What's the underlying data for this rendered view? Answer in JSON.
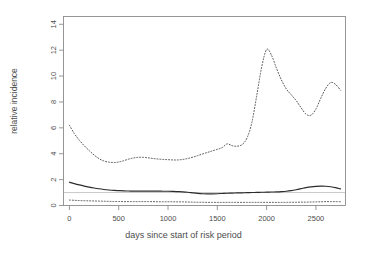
{
  "chart_data": {
    "type": "line",
    "title": "",
    "xlabel": "days since start of risk period",
    "ylabel": "relative incidence",
    "xlim": [
      -60,
      2800
    ],
    "ylim": [
      0,
      14.6
    ],
    "xticks": [
      0,
      500,
      1000,
      1500,
      2000,
      2500
    ],
    "yticks": [
      0,
      2,
      4,
      6,
      8,
      10,
      12,
      14
    ],
    "xtick_labels": [
      "0",
      "500",
      "1000",
      "1500",
      "2000",
      "2500"
    ],
    "ytick_labels": [
      "0",
      "2",
      "4",
      "6",
      "8",
      "10",
      "12",
      "14"
    ],
    "grid": false,
    "legend": "none",
    "reference_line": {
      "y": 1,
      "style": "solid",
      "color": "#b0b0b0"
    },
    "x": [
      0,
      50,
      100,
      150,
      200,
      250,
      300,
      350,
      400,
      450,
      500,
      550,
      600,
      650,
      700,
      750,
      800,
      850,
      900,
      950,
      1000,
      1050,
      1100,
      1150,
      1200,
      1250,
      1300,
      1350,
      1400,
      1450,
      1500,
      1550,
      1600,
      1650,
      1700,
      1750,
      1800,
      1850,
      1900,
      1950,
      2000,
      2050,
      2100,
      2150,
      2200,
      2250,
      2300,
      2350,
      2400,
      2450,
      2500,
      2550,
      2600,
      2650,
      2700,
      2750
    ],
    "series": [
      {
        "name": "upper confidence limit",
        "style": "dotted",
        "color": "#555555",
        "values": [
          6.2,
          5.55,
          5.05,
          4.62,
          4.25,
          3.9,
          3.62,
          3.44,
          3.35,
          3.32,
          3.36,
          3.46,
          3.58,
          3.67,
          3.72,
          3.72,
          3.68,
          3.63,
          3.59,
          3.56,
          3.54,
          3.52,
          3.52,
          3.56,
          3.63,
          3.73,
          3.85,
          3.98,
          4.1,
          4.22,
          4.34,
          4.48,
          4.76,
          4.62,
          4.58,
          4.7,
          5.2,
          6.4,
          8.5,
          10.7,
          12.05,
          11.6,
          10.6,
          9.7,
          9.0,
          8.55,
          8.1,
          7.55,
          7.05,
          6.98,
          7.45,
          8.3,
          9.05,
          9.5,
          9.35,
          8.9
        ]
      },
      {
        "name": "relative incidence estimate",
        "style": "solid",
        "color": "#2b2b2b",
        "values": [
          1.8,
          1.69,
          1.59,
          1.5,
          1.42,
          1.35,
          1.29,
          1.24,
          1.2,
          1.17,
          1.15,
          1.13,
          1.12,
          1.11,
          1.11,
          1.11,
          1.11,
          1.11,
          1.11,
          1.1,
          1.1,
          1.09,
          1.07,
          1.05,
          1.02,
          0.98,
          0.94,
          0.91,
          0.9,
          0.9,
          0.91,
          0.93,
          0.95,
          0.96,
          0.97,
          0.98,
          0.99,
          1.0,
          1.01,
          1.02,
          1.03,
          1.04,
          1.05,
          1.07,
          1.1,
          1.15,
          1.22,
          1.3,
          1.38,
          1.44,
          1.48,
          1.5,
          1.49,
          1.45,
          1.38,
          1.28
        ]
      },
      {
        "name": "lower confidence limit",
        "style": "dotted",
        "color": "#555555",
        "values": [
          0.42,
          0.4,
          0.38,
          0.37,
          0.36,
          0.35,
          0.34,
          0.33,
          0.32,
          0.31,
          0.31,
          0.3,
          0.3,
          0.3,
          0.3,
          0.3,
          0.3,
          0.3,
          0.29,
          0.29,
          0.29,
          0.29,
          0.28,
          0.28,
          0.27,
          0.26,
          0.25,
          0.25,
          0.24,
          0.24,
          0.24,
          0.24,
          0.24,
          0.24,
          0.24,
          0.24,
          0.24,
          0.24,
          0.24,
          0.24,
          0.24,
          0.24,
          0.24,
          0.24,
          0.24,
          0.25,
          0.25,
          0.26,
          0.26,
          0.27,
          0.28,
          0.29,
          0.3,
          0.3,
          0.3,
          0.29
        ]
      }
    ]
  },
  "axes": {
    "xlabel": "days since start of risk period",
    "ylabel": "relative incidence"
  }
}
